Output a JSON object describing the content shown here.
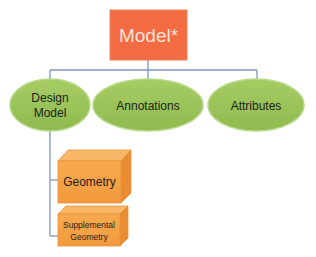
{
  "diagram": {
    "root": {
      "label": "Model*",
      "fill": "#F26B43",
      "text_color": "#FCE3D8"
    },
    "children": [
      {
        "label_line1": "Design",
        "label_line2": "Model",
        "fill": "#9BC55A"
      },
      {
        "label": "Annotations",
        "fill": "#9BC55A"
      },
      {
        "label": "Attributes",
        "fill": "#9BC55A"
      }
    ],
    "sub_children": [
      {
        "label": "Geometry",
        "fill": "#F6A04A"
      },
      {
        "label_line1": "Supplemental",
        "label_line2": "Geometry",
        "fill": "#F6A04A"
      }
    ],
    "connector_color": "#7F96BE",
    "ellipse_stroke": "#B8D98A",
    "text_color": "#1E1E1E"
  }
}
